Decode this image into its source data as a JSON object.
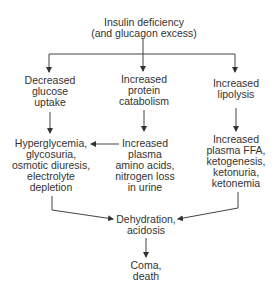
{
  "diagram": {
    "nodes": {
      "root": {
        "lines": [
          "Insulin deficiency",
          "(and glucagon excess)"
        ]
      },
      "glucose_uptake": {
        "lines": [
          "Decreased",
          "glucose",
          "uptake"
        ]
      },
      "protein_catabolism": {
        "lines": [
          "Increased",
          "protein",
          "catabolism"
        ]
      },
      "lipolysis": {
        "lines": [
          "Increased",
          "lipolysis"
        ]
      },
      "hyperglycemia": {
        "lines": [
          "Hyperglycemia,",
          "glycosuria,",
          "osmotic diuresis,",
          "electrolyte",
          "depletion"
        ]
      },
      "amino_acids": {
        "lines": [
          "Increased",
          "plasma",
          "amino acids,",
          "nitrogen loss",
          "in urine"
        ]
      },
      "ffa": {
        "lines": [
          "Increased",
          "plasma FFA,",
          "ketogenesis,",
          "ketonuria,",
          "ketonemia"
        ]
      },
      "dehydration": {
        "lines": [
          "Dehydration,",
          "acidosis"
        ]
      },
      "coma": {
        "lines": [
          "Coma,",
          "death"
        ]
      }
    },
    "edges": [
      {
        "from": "root",
        "to": "glucose_uptake"
      },
      {
        "from": "root",
        "to": "protein_catabolism"
      },
      {
        "from": "root",
        "to": "lipolysis"
      },
      {
        "from": "glucose_uptake",
        "to": "hyperglycemia"
      },
      {
        "from": "protein_catabolism",
        "to": "amino_acids"
      },
      {
        "from": "lipolysis",
        "to": "ffa"
      },
      {
        "from": "amino_acids",
        "to": "hyperglycemia"
      },
      {
        "from": "hyperglycemia",
        "to": "dehydration"
      },
      {
        "from": "ffa",
        "to": "dehydration"
      },
      {
        "from": "dehydration",
        "to": "coma"
      }
    ],
    "line_color": "#444444",
    "text_color": "#333333"
  }
}
